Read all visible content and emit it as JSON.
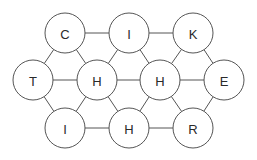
{
  "diagram": {
    "type": "hexagonal-letter-grid",
    "nodes": [
      {
        "id": "n1",
        "label": "C",
        "x": 65,
        "y": 33
      },
      {
        "id": "n2",
        "label": "I",
        "x": 129,
        "y": 33
      },
      {
        "id": "n3",
        "label": "K",
        "x": 193,
        "y": 33
      },
      {
        "id": "n4",
        "label": "T",
        "x": 33,
        "y": 80
      },
      {
        "id": "n5",
        "label": "H",
        "x": 97,
        "y": 80
      },
      {
        "id": "n6",
        "label": "H",
        "x": 160,
        "y": 80
      },
      {
        "id": "n7",
        "label": "E",
        "x": 224,
        "y": 80
      },
      {
        "id": "n8",
        "label": "I",
        "x": 65,
        "y": 128
      },
      {
        "id": "n9",
        "label": "H",
        "x": 129,
        "y": 128
      },
      {
        "id": "n10",
        "label": "R",
        "x": 193,
        "y": 128
      }
    ],
    "edges": [
      [
        "n1",
        "n2"
      ],
      [
        "n2",
        "n3"
      ],
      [
        "n4",
        "n5"
      ],
      [
        "n5",
        "n6"
      ],
      [
        "n6",
        "n7"
      ],
      [
        "n8",
        "n9"
      ],
      [
        "n9",
        "n10"
      ],
      [
        "n1",
        "n4"
      ],
      [
        "n1",
        "n5"
      ],
      [
        "n2",
        "n5"
      ],
      [
        "n2",
        "n6"
      ],
      [
        "n3",
        "n6"
      ],
      [
        "n3",
        "n7"
      ],
      [
        "n4",
        "n8"
      ],
      [
        "n5",
        "n8"
      ],
      [
        "n5",
        "n9"
      ],
      [
        "n6",
        "n9"
      ],
      [
        "n6",
        "n10"
      ],
      [
        "n7",
        "n10"
      ]
    ],
    "node_radius": 20,
    "colors": {
      "stroke": "#555555",
      "fill": "#ffffff",
      "text": "#2a2a2a"
    }
  }
}
